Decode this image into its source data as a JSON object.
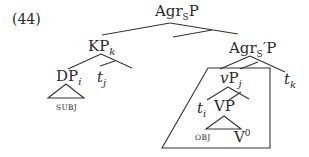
{
  "example_number": "(44)",
  "nodes": {
    "root": {
      "base": "Agr",
      "sub": "S",
      "tail": "P"
    },
    "kp": {
      "base": "KP",
      "index": "k"
    },
    "agrsbar": {
      "base": "Agr",
      "sub": "S",
      "tail": "′P"
    },
    "dp": {
      "base": "DP",
      "index": "i"
    },
    "tj": {
      "base": "t",
      "index": "j"
    },
    "tk": {
      "base": "t",
      "index": "k"
    },
    "vp_light": {
      "base": "v",
      "tail": "P",
      "index": "j"
    },
    "ti": {
      "base": "t",
      "index": "i"
    },
    "vp": {
      "label": "VP"
    },
    "v0": {
      "base": "V",
      "sup": "0"
    }
  },
  "leaf_labels": {
    "subj": "SUBJ",
    "obj": "OBJ"
  },
  "colors": {
    "line": "#333333",
    "text": "#2a2a2a",
    "background": "#ffffff"
  }
}
